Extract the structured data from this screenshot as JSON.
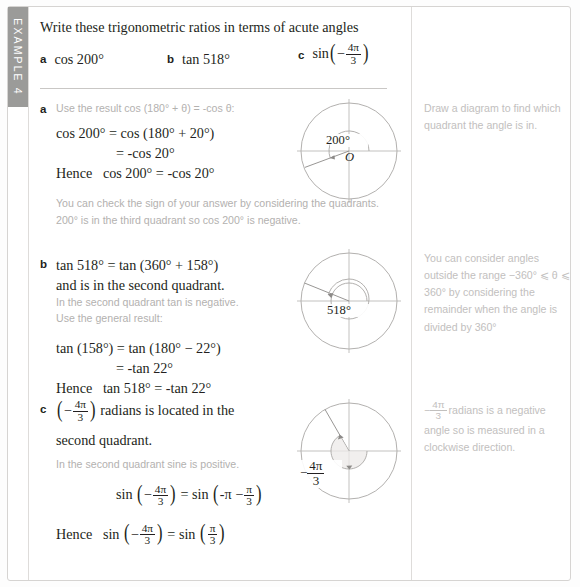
{
  "example": {
    "tab_label": "EXAMPLE 4"
  },
  "question": {
    "prompt": "Write these trigonometric ratios in terms of acute angles",
    "parts": [
      {
        "letter": "a",
        "expr": "cos 200°"
      },
      {
        "letter": "b",
        "expr": "tan 518°"
      },
      {
        "letter": "c",
        "expr_prefix": "sin",
        "frac_num": "4π",
        "frac_den": "3",
        "sign": "−"
      }
    ]
  },
  "solutions": {
    "a": {
      "letter": "a",
      "intro_note": "Use the result cos (180° + θ) = -cos θ:",
      "line1": "cos 200° = cos (180° + 20°)",
      "line2": "= -cos 20°",
      "hence_label": "Hence",
      "hence_expr": "cos 200° = -cos 20°",
      "check_note": "You can check the sign of your answer by considering the quadrants. 200° is in the third quadrant so cos 200° is negative."
    },
    "b": {
      "letter": "b",
      "line1": "tan 518° = tan (360° + 158°)",
      "line2": "and is in the second quadrant.",
      "note1": "In the second quadrant tan is negative.",
      "note2": "Use the general result:",
      "line3": "tan (158°) = tan (180° − 22°)",
      "line4": "= -tan 22°",
      "hence_label": "Hence",
      "hence_expr": "tan 518° = -tan 22°"
    },
    "c": {
      "letter": "c",
      "line1_prefix": "",
      "line1_suffix": "radians is located in the",
      "line2": "second quadrant.",
      "note1": "In the second quadrant sine is positive.",
      "eq_lhs": "sin",
      "eq_eq": "=",
      "eq_rhs": "sin",
      "hence_label": "Hence",
      "frac_num": "4π",
      "frac_den": "3",
      "pi_over_3_num": "π",
      "pi_over_3_den": "3",
      "minus_pi": "-π −"
    }
  },
  "margin_notes": {
    "a": "Draw a diagram to find which quadrant the angle is in.",
    "b": "You can consider angles outside the range −360° ⩽ θ ⩽ 360° by considering the remainder when the angle is divided by 360°",
    "c_prefix": "",
    "c_num": "4π",
    "c_den": "3",
    "c_suffix": "radians is a negative angle so is measured in a clockwise direction."
  },
  "diagrams": {
    "a": {
      "angle_label": "200°",
      "origin_label": "O",
      "angle_deg": 200,
      "direction": "anticlockwise"
    },
    "b": {
      "angle_label": "518°",
      "angle_deg": 518,
      "direction": "anticlockwise"
    },
    "c": {
      "angle_num": "4π",
      "angle_den": "3",
      "angle_sign": "−",
      "angle_deg": -240,
      "direction": "clockwise"
    }
  },
  "colors": {
    "text": "#231f20",
    "note_text": "#b3b1af",
    "margin_note_text": "#c2c0be",
    "tab_bg": "#9b9b99",
    "rule": "#d6d4d2",
    "diagram_stroke": "#8c8a88"
  }
}
